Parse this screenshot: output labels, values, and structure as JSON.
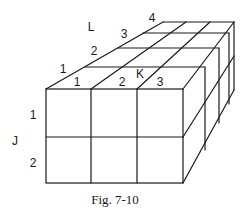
{
  "figure": {
    "caption": "Fig. 7-10",
    "dimensions": {
      "K": 3,
      "L": 4,
      "J": 2
    }
  },
  "axes": {
    "J": {
      "name": "J",
      "ticks": [
        "1",
        "2"
      ]
    },
    "K": {
      "name": "K",
      "ticks": [
        "1",
        "2",
        "3"
      ]
    },
    "L": {
      "name": "L",
      "ticks": [
        "1",
        "2",
        "3",
        "4"
      ]
    }
  },
  "colors": {
    "line": "#1a1a1a",
    "background": "#ffffff"
  }
}
